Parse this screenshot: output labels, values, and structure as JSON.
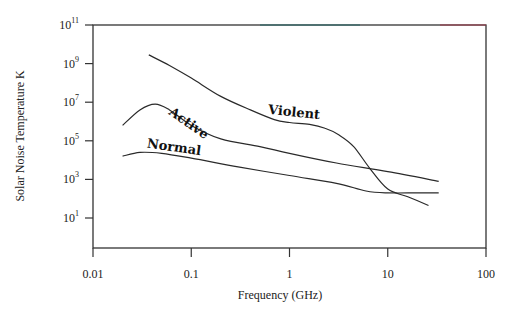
{
  "chart_data": {
    "type": "line",
    "title": "",
    "xlabel": "Frequency (GHz)",
    "ylabel": "Solar Noise Temperature K",
    "xscale": "log",
    "yscale": "log",
    "xlim": [
      0.01,
      100
    ],
    "ylim_log10": [
      0.2,
      11
    ],
    "x_ticks": [
      {
        "value": 0.01,
        "label": "0.01"
      },
      {
        "value": 0.1,
        "label": "0.1"
      },
      {
        "value": 1,
        "label": "1"
      },
      {
        "value": 10,
        "label": "10"
      },
      {
        "value": 100,
        "label": "100"
      }
    ],
    "y_ticks": [
      {
        "exp": 11,
        "base": "10",
        "sup": "11"
      },
      {
        "exp": 9,
        "base": "10",
        "sup": "9"
      },
      {
        "exp": 7,
        "base": "10",
        "sup": "7"
      },
      {
        "exp": 5,
        "base": "10",
        "sup": "5"
      },
      {
        "exp": 3,
        "base": "10",
        "sup": "3"
      },
      {
        "exp": 1,
        "base": "10",
        "sup": "1"
      }
    ],
    "grid": false,
    "legend": "inline curve labels",
    "series": [
      {
        "name": "Violent",
        "points": [
          [
            0.037,
            9.45
          ],
          [
            0.06,
            8.9
          ],
          [
            0.1,
            8.25
          ],
          [
            0.2,
            7.3
          ],
          [
            0.4,
            6.6
          ],
          [
            0.7,
            6.1
          ],
          [
            1.0,
            5.95
          ],
          [
            1.6,
            5.85
          ],
          [
            2.3,
            5.65
          ],
          [
            3.2,
            5.3
          ],
          [
            4.5,
            4.7
          ],
          [
            6.5,
            3.6
          ],
          [
            10,
            2.5
          ],
          [
            16,
            2.1
          ],
          [
            26,
            1.65
          ]
        ],
        "label_pos": {
          "x": 0.6,
          "logy": 6.4,
          "rotate": 6
        }
      },
      {
        "name": "Active",
        "points": [
          [
            0.02,
            5.8
          ],
          [
            0.03,
            6.6
          ],
          [
            0.043,
            6.9
          ],
          [
            0.06,
            6.6
          ],
          [
            0.1,
            5.8
          ],
          [
            0.2,
            5.1
          ],
          [
            0.5,
            4.7
          ],
          [
            1,
            4.35
          ],
          [
            3,
            3.85
          ],
          [
            10,
            3.4
          ],
          [
            33,
            2.9
          ]
        ],
        "label_pos": {
          "x": 0.058,
          "logy": 6.4,
          "rotate": 35
        }
      },
      {
        "name": "Normal",
        "points": [
          [
            0.02,
            4.2
          ],
          [
            0.03,
            4.4
          ],
          [
            0.05,
            4.35
          ],
          [
            0.1,
            4.1
          ],
          [
            0.3,
            3.65
          ],
          [
            1,
            3.2
          ],
          [
            3,
            2.8
          ],
          [
            6,
            2.4
          ],
          [
            10,
            2.3
          ],
          [
            20,
            2.3
          ],
          [
            33,
            2.3
          ]
        ],
        "label_pos": {
          "x": 0.035,
          "logy": 4.65,
          "rotate": 8
        }
      }
    ],
    "layout_px": {
      "plot_left": 93,
      "plot_right": 486,
      "plot_top": 25,
      "plot_bottom": 248,
      "x_px_per_decade": 98.25,
      "y_px_per_decade": 19.3
    }
  }
}
